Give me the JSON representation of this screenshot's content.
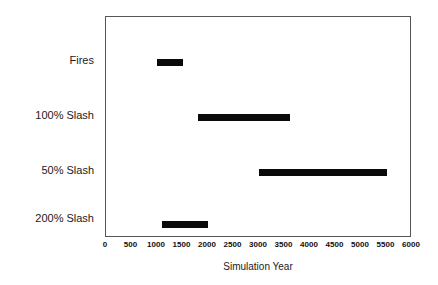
{
  "chart_data": {
    "type": "bar",
    "orientation": "horizontal",
    "subtype": "range-bar",
    "title": "",
    "xlabel": "Simulation Year",
    "ylabel": "",
    "xlim": [
      0,
      6000
    ],
    "xticks": [
      0,
      500,
      1000,
      1500,
      2000,
      2500,
      3000,
      3500,
      4000,
      4500,
      5000,
      5500,
      6000
    ],
    "xtick_labels": [
      "0",
      "500",
      "1000",
      "1500",
      "2000",
      "2500",
      "3000",
      "3500",
      "4000",
      "4500",
      "5000",
      "5500",
      "6000"
    ],
    "grid": false,
    "legend": false,
    "categories": [
      "Fires",
      "100% Slash",
      "50% Slash",
      "200% Slash"
    ],
    "bar_color": "#0a0a0a",
    "frame_color": "#555555",
    "background": "#ffffff",
    "bars": [
      {
        "category": "Fires",
        "start": 1000,
        "end": 1500,
        "duration": 500
      },
      {
        "category": "100% Slash",
        "start": 1800,
        "end": 3600,
        "duration": 1800
      },
      {
        "category": "50% Slash",
        "start": 3000,
        "end": 5500,
        "duration": 2500
      },
      {
        "category": "200% Slash",
        "start": 1100,
        "end": 2000,
        "duration": 900
      }
    ]
  }
}
